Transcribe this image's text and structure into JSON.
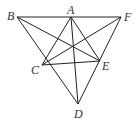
{
  "diagram": {
    "points": {
      "A": {
        "label": "A",
        "x": 71,
        "y": 17
      },
      "B": {
        "label": "B",
        "x": 17,
        "y": 17
      },
      "F": {
        "label": "F",
        "x": 121,
        "y": 17
      },
      "C": {
        "label": "C",
        "x": 42,
        "y": 65
      },
      "E": {
        "label": "E",
        "x": 100,
        "y": 61
      },
      "D": {
        "label": "D",
        "x": 78,
        "y": 104
      }
    },
    "segments": [
      [
        "B",
        "F"
      ],
      [
        "B",
        "D"
      ],
      [
        "F",
        "D"
      ],
      [
        "B",
        "E"
      ],
      [
        "F",
        "C"
      ],
      [
        "A",
        "C"
      ],
      [
        "A",
        "E"
      ],
      [
        "A",
        "D"
      ],
      [
        "C",
        "E"
      ]
    ],
    "labels": {
      "A": "A",
      "B": "B",
      "C": "C",
      "D": "D",
      "E": "E",
      "F": "F"
    },
    "colors": {
      "stroke": "#222222",
      "text": "#333333"
    }
  }
}
